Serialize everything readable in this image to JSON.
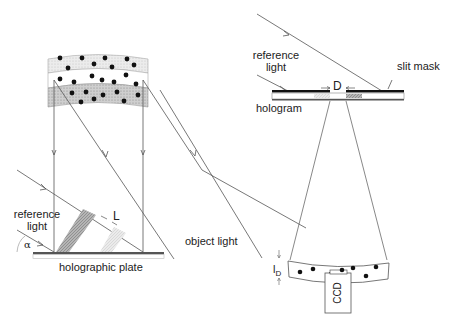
{
  "recording_panel": {
    "reference_light_label": [
      "reference",
      "light"
    ],
    "angle_label": "α",
    "fringe_spacing_label": "L",
    "plate_label": "holographic plate",
    "object_light_label": "object light"
  },
  "reconstruction_panel": {
    "reference_light_label": [
      "reference",
      "light"
    ],
    "slit_mask_label": "slit mask",
    "slit_width_label": "D",
    "hologram_label": "hologram",
    "depth_label": "l",
    "depth_subscript": "D",
    "detector_label": "CCD"
  },
  "colors": {
    "line": "#555555",
    "particle": "#111111",
    "band_light": "#e4e4e4",
    "band_dark": "#c8c8c8",
    "plate": "#555555",
    "mask": "#111111"
  }
}
